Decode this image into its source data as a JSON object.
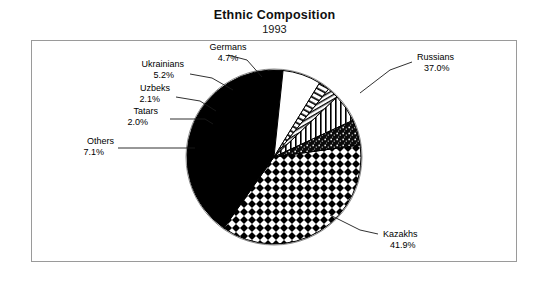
{
  "chart_data": {
    "type": "pie",
    "title": "Ethnic Composition",
    "subtitle": "1993",
    "xlabel": "",
    "ylabel": "",
    "legend_position": "none",
    "grid": false,
    "units": "percent",
    "categories": [
      "Russians",
      "Kazakhs",
      "Others",
      "Tatars",
      "Uzbeks",
      "Ukrainians",
      "Germans"
    ],
    "values": [
      37.0,
      41.9,
      7.1,
      2.0,
      2.1,
      5.2,
      4.7
    ],
    "slices": [
      {
        "label": "Russians",
        "value": 37.0,
        "display": "37.0%",
        "pattern": "crosshatch-diamond",
        "start_deg": -8.0,
        "end_deg": 125.2
      },
      {
        "label": "Kazakhs",
        "value": 41.9,
        "display": "41.9%",
        "pattern": "solid-black",
        "start_deg": 125.2,
        "end_deg": 276.0
      },
      {
        "label": "Others",
        "value": 7.1,
        "display": "7.1%",
        "pattern": "white",
        "start_deg": 276.0,
        "end_deg": 301.6
      },
      {
        "label": "Tatars",
        "value": 2.0,
        "display": "2.0%",
        "pattern": "diagonal-hatch",
        "start_deg": 301.6,
        "end_deg": 308.8
      },
      {
        "label": "Uzbeks",
        "value": 2.1,
        "display": "2.1%",
        "pattern": "fine-diagonal",
        "start_deg": 308.8,
        "end_deg": 316.4
      },
      {
        "label": "Ukrainians",
        "value": 5.2,
        "display": "5.2%",
        "pattern": "vertical-stripes",
        "start_deg": 316.4,
        "end_deg": 335.1
      },
      {
        "label": "Germans",
        "value": 4.7,
        "display": "4.7%",
        "pattern": "speckled-dark",
        "start_deg": 335.1,
        "end_deg": 352.0
      }
    ],
    "colors": {
      "stroke": "#000000",
      "fill_black": "#000000",
      "fill_white": "#ffffff",
      "frame": "#9a9a9a",
      "text": "#000000"
    }
  },
  "labels": {
    "russians": {
      "name": "Russians",
      "pct": "37.0%"
    },
    "kazakhs": {
      "name": "Kazakhs",
      "pct": "41.9%"
    },
    "others": {
      "name": "Others",
      "pct": "7.1%"
    },
    "tatars": {
      "name": "Tatars",
      "pct": "2.0%"
    },
    "uzbeks": {
      "name": "Uzbeks",
      "pct": "2.1%"
    },
    "ukrainians": {
      "name": "Ukrainians",
      "pct": "5.2%"
    },
    "germans": {
      "name": "Germans",
      "pct": "4.7%"
    }
  }
}
